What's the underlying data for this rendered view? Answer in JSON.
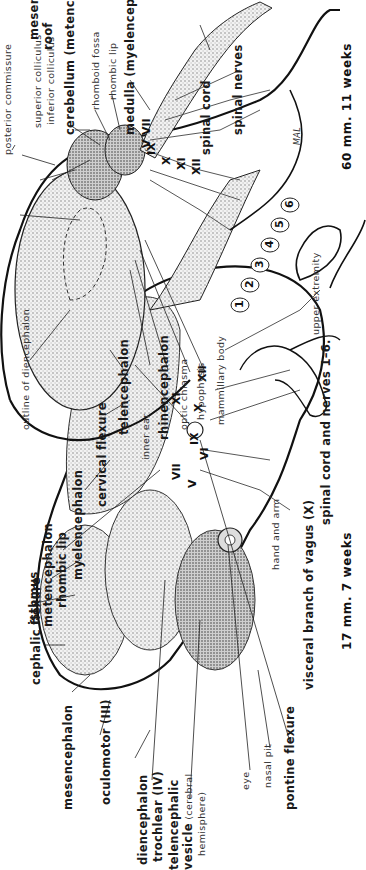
{
  "figure": {
    "panel_17mm": {
      "caption": "17 mm. 7 weeks",
      "labels": {
        "cephalic_flexure": "cephalic flexure",
        "isthmus": "isthmus",
        "metencephalon": "metencephalon",
        "rhombic_lip": "rhombic lip",
        "myelencephalon": "myelencephalon",
        "cervical_flexure": "cervical flexure",
        "mesencephalon": "mesencephalon",
        "oculomotor": "oculomotor (III)",
        "diencephalon": "diencephalon",
        "trochlear": "trochlear (IV)",
        "telencephalic": "telencephalic",
        "vesicle": "vesicle",
        "cerebral": "(cerebral",
        "hemisphere": "hemisphere)",
        "eye": "eye",
        "nasal_pit": "nasal pit",
        "pontine_flexure": "pontine flexure",
        "visceral_branch": "visceral branch of vagus (X)",
        "hand_and_arm": "hand and arm",
        "inner_ear": "inner ear",
        "spinal_cord_nerves": "spinal cord and nerves 1–6."
      },
      "cranial_nerves": [
        "V",
        "VII",
        "VI",
        "IX",
        "X",
        "XI",
        "XII"
      ],
      "spinal_nerves": [
        "1",
        "2",
        "3",
        "4",
        "5",
        "6"
      ]
    },
    "panel_60mm": {
      "caption": "60 mm. 11 weeks",
      "labels": {
        "posterior_commissure": "posterior commissure",
        "superior_colliculus": "superior colliculus",
        "inferior_colliculus": "inferior colliculus",
        "mesencephalic_roof_1": "mesencephalic",
        "mesencephalic_roof_2": "roof",
        "cerebellum": "cerebellum (metencephalon)",
        "rhomboid_fossa": "rhomboid fossa",
        "rhombic_lip": "rhombic lip",
        "medulla": "medulla (myelencephalon)",
        "spinal_cord": "spinal cord",
        "spinal_nerves": "spinal nerves",
        "outline_of_diencephalon": "outline of diencephalon",
        "telencephalon": "telencephalon",
        "rhinencephalon": "rhinencephalon",
        "optic_chiasma": "optic chiasma",
        "hypophysis": "hypophysis",
        "mammillary_body": "mammillary body",
        "upper_extremity": "upper extremity"
      },
      "cranial_nerves": [
        "V",
        "VII",
        "IX",
        "X",
        "XI",
        "XII"
      ]
    },
    "signature": "MAL"
  }
}
